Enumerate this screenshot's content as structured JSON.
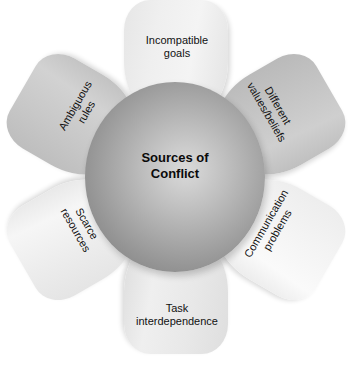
{
  "diagram": {
    "type": "radial-petal-diagram",
    "title": "Sources of Conflict",
    "background_color": "#ffffff",
    "center": {
      "label": "Sources of\nConflict",
      "shape": "sphere",
      "fill_light": "#d9d9d9",
      "fill_dark": "#7e7e7e"
    },
    "petals": [
      {
        "id": "incompatible-goals",
        "label": "Incompatible\ngoals",
        "position": "top",
        "angle_deg": 0,
        "text_rotation_deg": 0,
        "fill": "#f0f0f0"
      },
      {
        "id": "different-values-beliefs",
        "label": "Different\nvalues/beliefs",
        "position": "upper-right",
        "angle_deg": 60,
        "text_rotation_deg": 60,
        "fill": "#c6c6c6"
      },
      {
        "id": "communication-problems",
        "label": "Communication\nproblems",
        "position": "lower-right",
        "angle_deg": 120,
        "text_rotation_deg": -60,
        "fill": "#f6f6f6"
      },
      {
        "id": "task-interdependence",
        "label": "Task\ninterdependence",
        "position": "bottom",
        "angle_deg": 180,
        "text_rotation_deg": 0,
        "fill": "#e8e8e8"
      },
      {
        "id": "scarce-resources",
        "label": "Scarce\nresources",
        "position": "lower-left",
        "angle_deg": 240,
        "text_rotation_deg": 60,
        "fill": "#efefef"
      },
      {
        "id": "ambiguous-rules",
        "label": "Ambiguous\nrules",
        "position": "upper-left",
        "angle_deg": 300,
        "text_rotation_deg": -60,
        "fill": "#c8c8c8"
      }
    ]
  }
}
